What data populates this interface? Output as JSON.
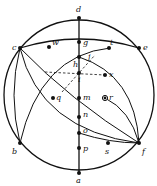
{
  "diagram": {
    "type": "stereographic projection / great-circle construction",
    "primitive_circle": {
      "cx": 79,
      "cy": 95,
      "r": 75
    },
    "points": [
      {
        "id": "d",
        "label": "d",
        "x": 79,
        "y": 18
      },
      {
        "id": "g",
        "label": "g",
        "x": 79,
        "y": 42
      },
      {
        "id": "h",
        "label": "h",
        "x": 79,
        "y": 57
      },
      {
        "id": "i",
        "label": "i",
        "x": 79,
        "y": 73
      },
      {
        "id": "m",
        "label": "m",
        "x": 79,
        "y": 98
      },
      {
        "id": "n",
        "label": "n",
        "x": 79,
        "y": 117
      },
      {
        "id": "o",
        "label": "o",
        "x": 79,
        "y": 133
      },
      {
        "id": "p",
        "label": "p",
        "x": 79,
        "y": 148
      },
      {
        "id": "a",
        "label": "a",
        "x": 79,
        "y": 173
      },
      {
        "id": "c",
        "label": "c",
        "x": 20,
        "y": 48
      },
      {
        "id": "w",
        "label": "w",
        "x": 49,
        "y": 47
      },
      {
        "id": "t",
        "label": "t",
        "x": 109,
        "y": 48
      },
      {
        "id": "e",
        "label": "e",
        "x": 139,
        "y": 48
      },
      {
        "id": "x",
        "label": "x",
        "x": 105,
        "y": 75
      },
      {
        "id": "q",
        "label": "q",
        "x": 53,
        "y": 98
      },
      {
        "id": "r",
        "label": "r",
        "x": 105,
        "y": 98
      },
      {
        "id": "b",
        "label": "b",
        "x": 20,
        "y": 143
      },
      {
        "id": "s",
        "label": "s",
        "x": 108,
        "y": 143
      },
      {
        "id": "f",
        "label": "f",
        "x": 139,
        "y": 143
      }
    ],
    "extra_labels": [
      {
        "id": "j",
        "label": "j",
        "x": 88,
        "y": 59
      },
      {
        "id": "k",
        "label": "k",
        "x": 80,
        "y": 82
      }
    ]
  }
}
